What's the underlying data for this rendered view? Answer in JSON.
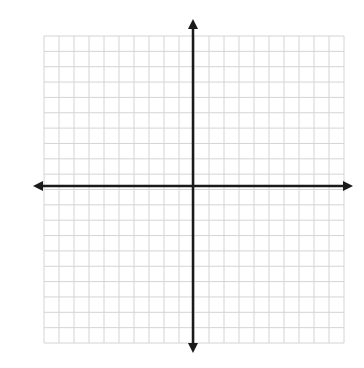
{
  "diagram": {
    "type": "coordinate-plane",
    "title": "",
    "grid": {
      "columns": 20,
      "rows": 20,
      "left": 44,
      "top": 36,
      "right": 344,
      "bottom": 343,
      "line_color": "#d4d4d4",
      "background": "#ffffff"
    },
    "axes": {
      "color": "#1a1a1a",
      "x_axis_y": 186,
      "y_axis_x": 193,
      "x_axis_start": 33,
      "x_axis_end": 353,
      "y_axis_start": 19,
      "y_axis_end": 353,
      "arrows": [
        "left",
        "right",
        "up",
        "down"
      ]
    },
    "labels": []
  }
}
